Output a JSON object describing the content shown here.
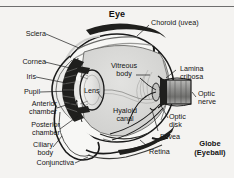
{
  "figure": {
    "title": "Eye",
    "caption_bold": "Globe\n(Eyeball)",
    "caption_line1": "Globe",
    "caption_line2": "(Eyeball)",
    "background_color": "#f4f3f1",
    "ink_color": "#141414",
    "rule_color": "#6e6e6e"
  },
  "labels": {
    "sclera": "Sclera",
    "cornea": "Cornea",
    "iris": "Iris",
    "pupil": "Pupil",
    "anterior_chamber_l1": "Anterior",
    "anterior_chamber_l2": "chamber",
    "posterior_chamber_l1": "Posterior",
    "posterior_chamber_l2": "chamber",
    "ciliary_body_l1": "Ciliary",
    "ciliary_body_l2": "body",
    "conjunctiva": "Conjunctiva",
    "choroid": "Choroid (uvea)",
    "lamina_l1": "Lamina",
    "lamina_l2": "cribosa",
    "optic_nerve_l1": "Optic",
    "optic_nerve_l2": "nerve",
    "optic_disk_l1": "Optic",
    "optic_disk_l2": "disk",
    "fovea": "Fovea",
    "retina": "Retina",
    "vitreous_body_l1": "Vitreous",
    "vitreous_body_l2": "body",
    "lens": "Lens",
    "hyaloid_canal_l1": "Hyaloid",
    "hyaloid_canal_l2": "canal"
  },
  "structures": [
    {
      "name": "sclera",
      "side": "left"
    },
    {
      "name": "cornea",
      "side": "left"
    },
    {
      "name": "iris",
      "side": "left"
    },
    {
      "name": "pupil",
      "side": "left"
    },
    {
      "name": "anterior-chamber",
      "side": "left"
    },
    {
      "name": "posterior-chamber",
      "side": "left"
    },
    {
      "name": "ciliary-body",
      "side": "left"
    },
    {
      "name": "conjunctiva",
      "side": "left"
    },
    {
      "name": "choroid-uvea",
      "side": "right"
    },
    {
      "name": "lamina-cribosa",
      "side": "right"
    },
    {
      "name": "optic-nerve",
      "side": "right"
    },
    {
      "name": "optic-disk",
      "side": "right"
    },
    {
      "name": "fovea",
      "side": "right"
    },
    {
      "name": "retina",
      "side": "right"
    },
    {
      "name": "vitreous-body",
      "side": "center"
    },
    {
      "name": "lens",
      "side": "center"
    },
    {
      "name": "hyaloid-canal",
      "side": "center"
    }
  ]
}
